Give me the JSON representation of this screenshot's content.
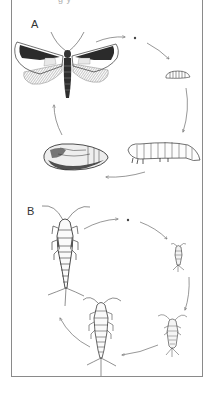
{
  "figure": {
    "caption_fragment": "g            y",
    "panels": [
      {
        "label": "A",
        "subject": "moth",
        "development": "complete metamorphosis",
        "stages": [
          "adult moth",
          "egg",
          "young larva",
          "mature larva (caterpillar)",
          "pupa"
        ]
      },
      {
        "label": "B",
        "subject": "silverfish",
        "development": "ametabolous (no metamorphosis)",
        "stages": [
          "adult",
          "egg",
          "small nymph",
          "medium nymph",
          "large nymph"
        ]
      }
    ]
  },
  "colors": {
    "ink": "#2a2a2a",
    "frame": "#8a8a8a",
    "background": "#ffffff",
    "arrow": "#6b6b6b"
  }
}
